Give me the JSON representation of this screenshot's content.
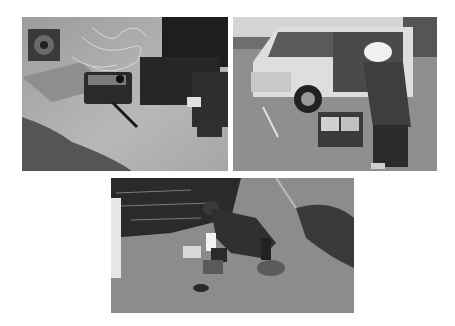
{
  "page": {
    "background": "#ffffff",
    "style": "grayscale photographs"
  },
  "photos": [
    {
      "id": "photo-1",
      "caption": "Portable generator, cable reels and equipment cases on concrete pavement"
    },
    {
      "id": "photo-2",
      "caption": "Person in helmet operating equipment next to a white van with open sliding door"
    },
    {
      "id": "photo-3",
      "caption": "Person crouching at waterside setting up measurement instruments on pavement"
    }
  ]
}
